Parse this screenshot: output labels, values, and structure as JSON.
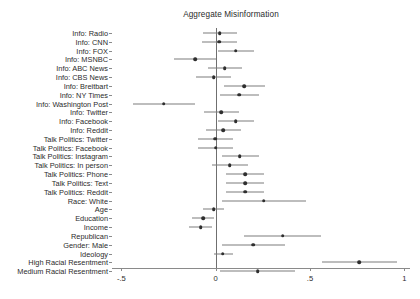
{
  "chart_data": {
    "type": "scatter",
    "subtype": "coefficient-plot",
    "title": "Aggregate Misinformation",
    "xlabel": "",
    "ylabel": "",
    "xlim": [
      -0.55,
      1.03
    ],
    "xticks": [
      -0.5,
      0,
      0.5,
      1
    ],
    "xticklabels": [
      "-.5",
      "0",
      ".5",
      "1"
    ],
    "grid": false,
    "legend": null,
    "reference_line": 0,
    "categories": [
      "Info: Radio",
      "Info: CNN",
      "Info: FOX",
      "Info: MSNBC",
      "Info: ABC News",
      "Info: CBS News",
      "Info: Breitbart",
      "Info: NY Times",
      "Info: Washington Post",
      "Info: Twitter",
      "Info: Facebook",
      "Info: Reddit",
      "Talk Politics: Twitter",
      "Talk Politics: Facebook",
      "Talk Politics: Instagram",
      "Talk Politics: In person",
      "Talk Politics: Phone",
      "Talk Politics: Text",
      "Talk Politics: Reddit",
      "Race: White",
      "Age",
      "Education",
      "Income",
      "Republican",
      "Gender: Male",
      "Ideology",
      "High Racial Resentment",
      "Medium Racial Resentment"
    ],
    "estimates": [
      0.022,
      0.018,
      0.105,
      -0.11,
      0.048,
      -0.01,
      0.152,
      0.125,
      -0.275,
      0.03,
      0.105,
      0.04,
      -0.002,
      -0.001,
      0.128,
      0.075,
      0.155,
      0.155,
      0.155,
      -0.06,
      0.03,
      0.042,
      0.042,
      0.042,
      -0.065,
      0.255,
      -0.01,
      -0.068
    ],
    "ci_low": [
      -0.07,
      -0.075,
      0.01,
      -0.22,
      -0.04,
      -0.105,
      0.045,
      0.022,
      -0.44,
      -0.06,
      0.01,
      -0.05,
      -0.095,
      -0.095,
      0.032,
      -0.02,
      0.055,
      0.055,
      0.055,
      -0.165,
      -0.05,
      -0.03,
      -0.03,
      -0.03,
      -0.16,
      0.03,
      -0.065,
      -0.125
    ],
    "ci_high": [
      0.115,
      0.112,
      0.205,
      0.002,
      0.14,
      0.082,
      0.262,
      0.232,
      -0.11,
      0.122,
      0.205,
      0.132,
      0.09,
      0.09,
      0.228,
      0.172,
      0.255,
      0.255,
      0.255,
      0.048,
      0.11,
      0.115,
      0.115,
      0.115,
      0.032,
      0.48,
      0.045,
      -0.01
    ],
    "series_note": "point estimates with 95% confidence intervals",
    "overrides": [
      {
        "index": 19,
        "estimate": 0.255,
        "ci_low": 0.035,
        "ci_high": 0.48
      },
      {
        "index": 20,
        "estimate": -0.01,
        "ci_low": -0.065,
        "ci_high": 0.045
      },
      {
        "index": 21,
        "estimate": -0.068,
        "ci_low": -0.125,
        "ci_high": -0.01
      },
      {
        "index": 22,
        "estimate": -0.08,
        "ci_low": -0.14,
        "ci_high": -0.02
      },
      {
        "index": 23,
        "estimate": 0.355,
        "ci_low": 0.15,
        "ci_high": 0.56
      },
      {
        "index": 24,
        "estimate": 0.2,
        "ci_low": 0.032,
        "ci_high": 0.368
      },
      {
        "index": 25,
        "estimate": 0.038,
        "ci_low": -0.01,
        "ci_high": 0.09
      },
      {
        "index": 26,
        "estimate": 0.76,
        "ci_low": 0.565,
        "ci_high": 0.96
      },
      {
        "index": 27,
        "estimate": 0.222,
        "ci_low": 0.02,
        "ci_high": 0.42
      }
    ]
  },
  "colors": {
    "point": "#2e2e2e",
    "interval": "#7d7d7d",
    "axis": "#8a8a8a",
    "zero_line": "#6f6f6f",
    "text": "#2b2b2b",
    "background": "#ffffff"
  }
}
